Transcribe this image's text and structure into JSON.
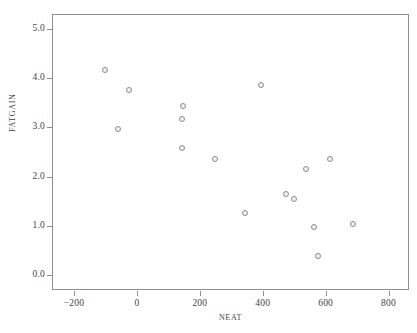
{
  "figure": {
    "title_partial": "",
    "background_color": "#ffffff"
  },
  "axes": {
    "x": {
      "label": "NEAT",
      "ticks": [
        -200,
        0,
        200,
        400,
        600,
        800
      ],
      "tick_labels": [
        "−200",
        "0",
        "200",
        "400",
        "600",
        "800"
      ],
      "limits": [
        -270,
        865
      ],
      "grid": false
    },
    "y": {
      "label": "FATGAIN",
      "ticks": [
        0.0,
        1.0,
        2.0,
        3.0,
        4.0,
        5.0
      ],
      "tick_labels": [
        "0.0",
        "1.0",
        "2.0",
        "3.0",
        "4.0",
        "5.0"
      ],
      "limits": [
        -0.3,
        5.3
      ],
      "grid": false
    },
    "frame_color": "#8e8e93"
  },
  "marker": {
    "shape": "open-circle",
    "stroke_color": "#8a8a90",
    "fill_color": "#f2f2f4",
    "diameter_px": 6
  },
  "chart_data": {
    "type": "scatter",
    "title": "",
    "xlabel": "NEAT",
    "ylabel": "FATGAIN",
    "xlim": [
      -270,
      865
    ],
    "ylim": [
      -0.3,
      5.3
    ],
    "grid": false,
    "series": [
      {
        "name": "subjects",
        "marker": "open-circle",
        "points": [
          {
            "x": -103,
            "y": 4.16
          },
          {
            "x": -61,
            "y": 2.97
          },
          {
            "x": -24,
            "y": 3.75
          },
          {
            "x": 142,
            "y": 2.59
          },
          {
            "x": 143,
            "y": 3.17
          },
          {
            "x": 146,
            "y": 3.44
          },
          {
            "x": 247,
            "y": 2.35
          },
          {
            "x": 344,
            "y": 1.26
          },
          {
            "x": 394,
            "y": 3.86
          },
          {
            "x": 474,
            "y": 1.65
          },
          {
            "x": 499,
            "y": 1.55
          },
          {
            "x": 536,
            "y": 2.15
          },
          {
            "x": 564,
            "y": 0.97
          },
          {
            "x": 575,
            "y": 0.4
          },
          {
            "x": 614,
            "y": 2.35
          },
          {
            "x": 688,
            "y": 1.05
          }
        ]
      }
    ]
  }
}
